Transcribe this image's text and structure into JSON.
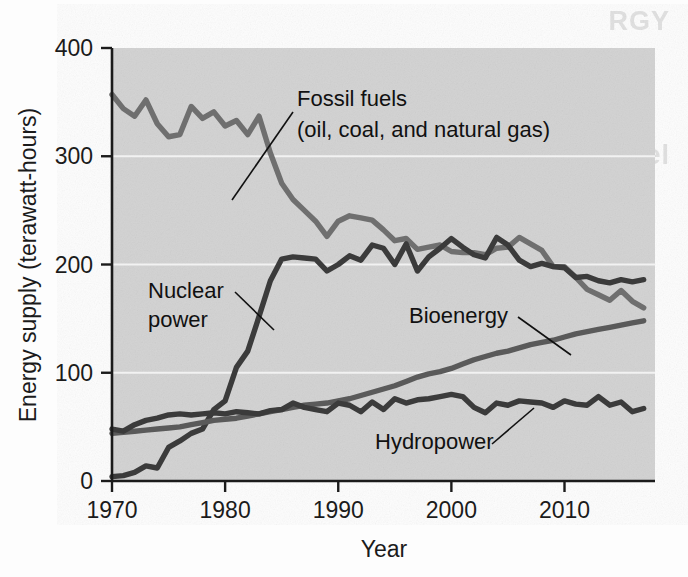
{
  "figure": {
    "type": "scanned-textbook-line-chart",
    "background_color": "#d2d2d2",
    "ghost_text": {
      "line1": "RGY",
      "line2": "en Free Israel",
      "line3": "idable"
    }
  },
  "chart_data": {
    "type": "line",
    "title": "",
    "xlabel": "Year",
    "ylabel": "Energy supply (terawatt-hours)",
    "xlim": [
      1970,
      2018
    ],
    "ylim": [
      0,
      400
    ],
    "xticks": [
      1970,
      1980,
      1990,
      2000,
      2010
    ],
    "yticks": [
      0,
      100,
      200,
      300,
      400
    ],
    "grid": "horizontal-white",
    "legend": "inline-annotations",
    "x": [
      1970,
      1971,
      1972,
      1973,
      1974,
      1975,
      1976,
      1977,
      1978,
      1979,
      1980,
      1981,
      1982,
      1983,
      1984,
      1985,
      1986,
      1987,
      1988,
      1989,
      1990,
      1991,
      1992,
      1993,
      1994,
      1995,
      1996,
      1997,
      1998,
      1999,
      2000,
      2001,
      2002,
      2003,
      2004,
      2005,
      2006,
      2007,
      2008,
      2009,
      2010,
      2011,
      2012,
      2013,
      2014,
      2015,
      2016,
      2017
    ],
    "series": [
      {
        "name": "Fossil fuels",
        "sublabel": "(oil, coal, and natural gas)",
        "color": "#6f6f6f",
        "label_text": "Fossil fuels",
        "label_text2": "(oil, coal, and natural gas)",
        "values": [
          357,
          344,
          337,
          352,
          330,
          318,
          320,
          346,
          335,
          341,
          328,
          333,
          320,
          337,
          303,
          275,
          260,
          250,
          240,
          226,
          240,
          245,
          243,
          241,
          232,
          222,
          224,
          214,
          216,
          218,
          212,
          211,
          211,
          209,
          215,
          216,
          225,
          219,
          213,
          198,
          198,
          188,
          177,
          172,
          167,
          176,
          166,
          160
        ]
      },
      {
        "name": "Nuclear power",
        "color": "#3b3b3b",
        "label_text": "Nuclear",
        "label_text2": "power",
        "values": [
          4,
          5,
          8,
          14,
          12,
          31,
          37,
          44,
          48,
          66,
          74,
          105,
          120,
          152,
          185,
          205,
          207,
          206,
          205,
          194,
          200,
          208,
          204,
          218,
          215,
          200,
          219,
          194,
          207,
          215,
          224,
          216,
          209,
          206,
          225,
          218,
          204,
          198,
          201,
          198,
          197,
          188,
          189,
          185,
          183,
          186,
          184,
          186
        ]
      },
      {
        "name": "Bioenergy",
        "color": "#5a5a5a",
        "label_text": "Bioenergy",
        "values": [
          44,
          45,
          46,
          47,
          48,
          49,
          50,
          52,
          54,
          56,
          57,
          58,
          60,
          62,
          64,
          66,
          68,
          70,
          71,
          72,
          74,
          76,
          79,
          82,
          85,
          88,
          92,
          96,
          99,
          101,
          104,
          108,
          112,
          115,
          118,
          120,
          123,
          126,
          128,
          130,
          133,
          136,
          138,
          140,
          142,
          144,
          146,
          148
        ]
      },
      {
        "name": "Hydropower",
        "color": "#3b3b3b",
        "label_text": "Hydropower",
        "values": [
          48,
          46,
          52,
          56,
          58,
          61,
          62,
          61,
          62,
          63,
          62,
          64,
          63,
          62,
          65,
          66,
          72,
          68,
          66,
          64,
          72,
          70,
          64,
          73,
          66,
          76,
          72,
          75,
          76,
          78,
          80,
          78,
          68,
          63,
          72,
          70,
          74,
          73,
          72,
          68,
          74,
          71,
          70,
          78,
          70,
          73,
          64,
          67
        ]
      }
    ]
  }
}
